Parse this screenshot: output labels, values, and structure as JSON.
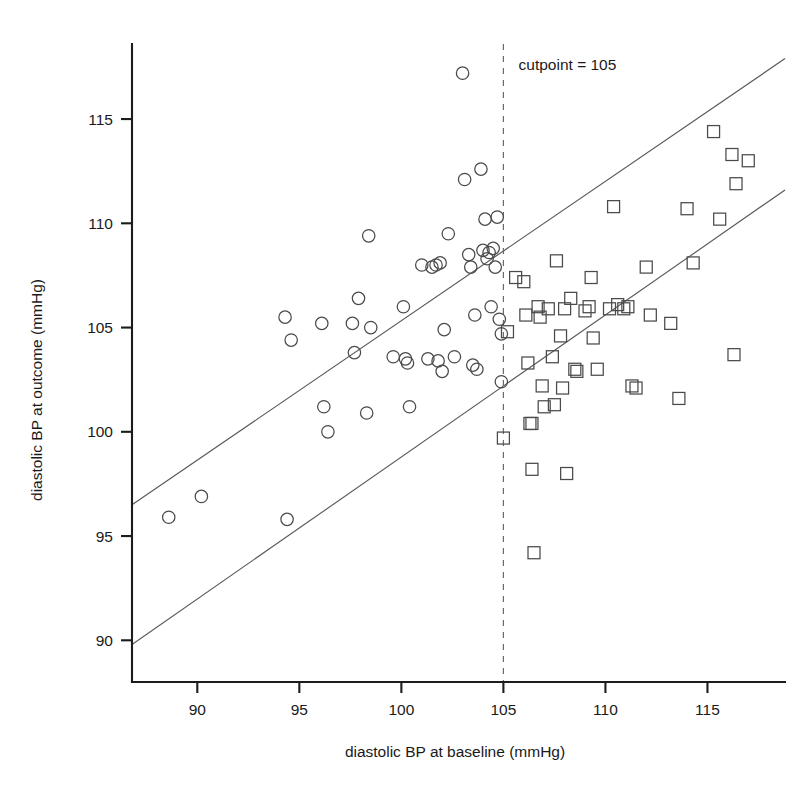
{
  "chart_data": {
    "type": "scatter",
    "title": "",
    "xlabel": "diastolic BP at baseline (mmHg)",
    "ylabel": "diastolic BP at outcome (mmHg)",
    "xlim": [
      86.8,
      118.8
    ],
    "ylim": [
      88.0,
      118.6
    ],
    "grid": false,
    "legend_position": "none",
    "xticks": [
      90,
      95,
      100,
      105,
      110,
      115
    ],
    "yticks": [
      90,
      95,
      100,
      105,
      110,
      115
    ],
    "xtick_labels": [
      "90",
      "95",
      "100",
      "105",
      "110",
      "115"
    ],
    "ytick_labels": [
      "90",
      "95",
      "100",
      "105",
      "110",
      "115"
    ],
    "annotations": [
      {
        "name": "cutpoint-annotation",
        "text": "cutpoint = 105",
        "x": 105.4,
        "y": 117.6
      }
    ],
    "reference_lines": [
      {
        "name": "upper-reference-line",
        "x1": 86.8,
        "y1": 96.5,
        "x2": 118.8,
        "y2": 117.9,
        "style": "solid"
      },
      {
        "name": "lower-reference-line",
        "x1": 86.8,
        "y1": 89.8,
        "x2": 118.8,
        "y2": 111.6,
        "style": "solid"
      }
    ],
    "cut_lines": [
      {
        "name": "cutpoint-line",
        "axis": "x",
        "value": 105,
        "y_top": 118.6,
        "y_bottom": 88.0,
        "style": "dashed"
      }
    ],
    "series": [
      {
        "name": "below cutpoint",
        "marker": "circle",
        "points": [
          [
            88.6,
            95.9
          ],
          [
            90.2,
            96.9
          ],
          [
            94.4,
            95.8
          ],
          [
            94.3,
            105.5
          ],
          [
            94.6,
            104.4
          ],
          [
            96.1,
            105.2
          ],
          [
            96.2,
            101.2
          ],
          [
            96.4,
            100.0
          ],
          [
            97.6,
            105.2
          ],
          [
            97.9,
            106.4
          ],
          [
            97.7,
            103.8
          ],
          [
            98.4,
            109.4
          ],
          [
            98.5,
            105.0
          ],
          [
            98.3,
            100.9
          ],
          [
            99.6,
            103.6
          ],
          [
            100.1,
            106.0
          ],
          [
            100.3,
            103.3
          ],
          [
            100.2,
            103.5
          ],
          [
            100.4,
            101.2
          ],
          [
            101.0,
            108.0
          ],
          [
            101.3,
            103.5
          ],
          [
            101.5,
            107.9
          ],
          [
            101.7,
            108.0
          ],
          [
            101.8,
            103.4
          ],
          [
            101.9,
            108.1
          ],
          [
            102.0,
            102.9
          ],
          [
            102.1,
            104.9
          ],
          [
            102.3,
            109.5
          ],
          [
            102.6,
            103.6
          ],
          [
            103.0,
            117.2
          ],
          [
            103.1,
            112.1
          ],
          [
            103.3,
            108.5
          ],
          [
            103.4,
            107.9
          ],
          [
            103.5,
            103.2
          ],
          [
            103.6,
            105.6
          ],
          [
            103.7,
            103.0
          ],
          [
            103.9,
            112.6
          ],
          [
            104.0,
            108.7
          ],
          [
            104.1,
            110.2
          ],
          [
            104.2,
            108.3
          ],
          [
            104.3,
            108.6
          ],
          [
            104.4,
            106.0
          ],
          [
            104.5,
            108.8
          ],
          [
            104.6,
            107.9
          ],
          [
            104.7,
            110.3
          ],
          [
            104.8,
            105.4
          ],
          [
            104.9,
            104.7
          ],
          [
            104.9,
            102.4
          ]
        ]
      },
      {
        "name": "at or above cutpoint",
        "marker": "square",
        "points": [
          [
            105.0,
            99.7
          ],
          [
            105.2,
            104.8
          ],
          [
            105.6,
            107.4
          ],
          [
            106.0,
            107.2
          ],
          [
            106.1,
            105.6
          ],
          [
            106.2,
            103.3
          ],
          [
            106.3,
            100.4
          ],
          [
            106.4,
            100.4
          ],
          [
            106.4,
            98.2
          ],
          [
            106.5,
            94.2
          ],
          [
            106.7,
            106.0
          ],
          [
            106.8,
            105.5
          ],
          [
            106.9,
            102.2
          ],
          [
            107.0,
            101.2
          ],
          [
            107.2,
            105.9
          ],
          [
            107.4,
            103.6
          ],
          [
            107.5,
            101.3
          ],
          [
            107.6,
            108.2
          ],
          [
            107.8,
            104.6
          ],
          [
            107.9,
            102.1
          ],
          [
            108.0,
            105.9
          ],
          [
            108.1,
            98.0
          ],
          [
            108.3,
            106.4
          ],
          [
            108.5,
            103.0
          ],
          [
            108.6,
            102.9
          ],
          [
            109.0,
            105.8
          ],
          [
            109.2,
            106.0
          ],
          [
            109.3,
            107.4
          ],
          [
            109.4,
            104.5
          ],
          [
            109.6,
            103.0
          ],
          [
            110.2,
            105.9
          ],
          [
            110.4,
            110.8
          ],
          [
            110.6,
            106.1
          ],
          [
            110.9,
            105.9
          ],
          [
            111.1,
            106.0
          ],
          [
            111.3,
            102.2
          ],
          [
            111.5,
            102.1
          ],
          [
            112.0,
            107.9
          ],
          [
            112.2,
            105.6
          ],
          [
            113.2,
            105.2
          ],
          [
            113.6,
            101.6
          ],
          [
            114.0,
            110.7
          ],
          [
            114.3,
            108.1
          ],
          [
            115.3,
            114.4
          ],
          [
            115.6,
            110.2
          ],
          [
            116.2,
            113.3
          ],
          [
            116.4,
            111.9
          ],
          [
            117.0,
            113.0
          ],
          [
            116.3,
            103.7
          ]
        ]
      }
    ]
  },
  "axes": {
    "x_title": "diastolic BP at baseline (mmHg)",
    "y_title": "diastolic BP at outcome (mmHg)"
  },
  "colors": {
    "axis": "#1c1c1c",
    "marker": "#4a4a4a",
    "reference_line": "#595959",
    "cut_line": "#6b6b6b",
    "background": "#ffffff"
  }
}
